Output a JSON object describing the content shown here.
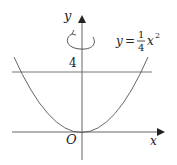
{
  "diagram": {
    "type": "function-graph",
    "axes": {
      "x_label": "x",
      "y_label": "y",
      "origin_label": "O"
    },
    "curve": {
      "equation_lhs": "y",
      "equation_eq": "=",
      "fraction_numerator": "1",
      "fraction_denominator": "4",
      "equation_var": "x",
      "equation_exponent": "2",
      "description": "parabola y = (1/4)x^2"
    },
    "horizontal_line": {
      "label": "4",
      "value": 4
    },
    "rotation_indicator": {
      "description": "rotation about the y-axis"
    },
    "colors": {
      "stroke": "#555555",
      "axis": "#444444",
      "text": "#222222"
    }
  }
}
